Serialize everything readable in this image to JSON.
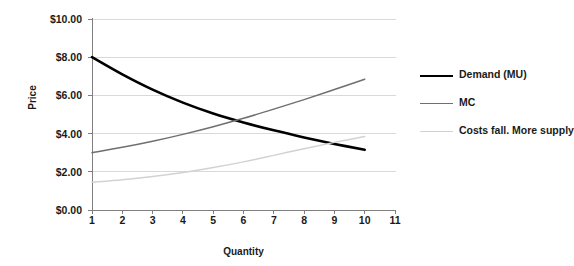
{
  "chart_data": {
    "type": "line",
    "title": "",
    "xlabel": "Quantity",
    "ylabel": "Price",
    "xlim": [
      1,
      11
    ],
    "ylim": [
      0,
      10
    ],
    "grid": "horizontal",
    "legend_position": "right",
    "x_tick_labels": [
      "1",
      "2",
      "3",
      "4",
      "5",
      "6",
      "7",
      "8",
      "9",
      "10",
      "11"
    ],
    "y_tick_labels": [
      "$0.00",
      "$2.00",
      "$4.00",
      "$6.00",
      "$8.00",
      "$10.00"
    ],
    "y_tick_values": [
      0,
      2,
      4,
      6,
      8,
      10
    ],
    "x": [
      1,
      2,
      3,
      4,
      5,
      6,
      7,
      8,
      9,
      10
    ],
    "series": [
      {
        "name": "Demand (MU)",
        "color": "#000000",
        "width": 2.6,
        "values": [
          8.0,
          7.1,
          6.3,
          5.62,
          5.05,
          4.58,
          4.17,
          3.8,
          3.46,
          3.15
        ]
      },
      {
        "name": "MC",
        "color": "#6f6f6f",
        "width": 1.5,
        "values": [
          3.0,
          3.28,
          3.6,
          3.96,
          4.36,
          4.8,
          5.28,
          5.78,
          6.31,
          6.85
        ]
      },
      {
        "name": "Costs fall. More supply",
        "color": "#d2d2d2",
        "width": 1.5,
        "values": [
          1.45,
          1.58,
          1.75,
          1.96,
          2.22,
          2.52,
          2.86,
          3.21,
          3.54,
          3.85
        ]
      }
    ]
  },
  "axes": {
    "y_title": "Price",
    "x_title": "Quantity"
  },
  "legend": {
    "items": [
      {
        "label": "Demand (MU)",
        "color": "#000000",
        "width": 2.6
      },
      {
        "label": "MC",
        "color": "#6f6f6f",
        "width": 1.5
      },
      {
        "label": "Costs fall. More supply",
        "color": "#d2d2d2",
        "width": 1.5
      }
    ]
  },
  "colors": {
    "axis": "#7f7f7f",
    "grid": "#d9d9d9",
    "text": "#1a1a1a",
    "background": "#ffffff"
  }
}
